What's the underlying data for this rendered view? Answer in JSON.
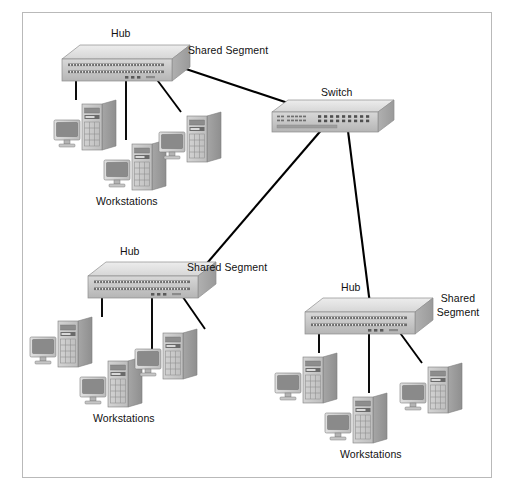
{
  "diagram": {
    "type": "network-topology",
    "background": "#ffffff",
    "frame_color": "#b9b9b9",
    "link_color": "#000000",
    "device_fill": "#c9c9c9",
    "device_top": "#e2e2e2",
    "device_side": "#a8a8a8",
    "monitor_screen": "#808080"
  },
  "labels": {
    "hub_top": "Hub",
    "hub_middle": "Hub",
    "hub_bottom_right": "Hub",
    "switch": "Switch",
    "shared_segment_top": "Shared Segment",
    "shared_segment_middle": "Shared Segment",
    "shared_segment_bottom_line1": "Shared",
    "shared_segment_bottom_line2": "Segment",
    "workstations_top": "Workstations",
    "workstations_middle": "Workstations",
    "workstations_bottom_right": "Workstations"
  },
  "devices": [
    {
      "id": "hub-top",
      "kind": "hub",
      "x": 62,
      "y": 45,
      "label": "Hub"
    },
    {
      "id": "switch",
      "kind": "switch",
      "x": 272,
      "y": 100,
      "label": "Switch"
    },
    {
      "id": "hub-middle",
      "kind": "hub",
      "x": 88,
      "y": 262,
      "label": "Hub"
    },
    {
      "id": "hub-bottom-right",
      "kind": "hub",
      "x": 305,
      "y": 298,
      "label": "Hub"
    }
  ],
  "workstation_groups": [
    {
      "id": "group-top",
      "label": "Workstations",
      "count": 3,
      "members": [
        "ws-top-1",
        "ws-top-2",
        "ws-top-3"
      ]
    },
    {
      "id": "group-middle",
      "label": "Workstations",
      "count": 3,
      "members": [
        "ws-mid-1",
        "ws-mid-2",
        "ws-mid-3"
      ]
    },
    {
      "id": "group-bottom-right",
      "label": "Workstations",
      "count": 3,
      "members": [
        "ws-br-1",
        "ws-br-2",
        "ws-br-3"
      ]
    }
  ],
  "links": [
    {
      "from": "hub-top",
      "to": "switch",
      "kind": "trunk"
    },
    {
      "from": "hub-middle",
      "to": "switch",
      "kind": "trunk"
    },
    {
      "from": "hub-bottom-right",
      "to": "switch",
      "kind": "trunk"
    },
    {
      "from": "hub-top",
      "to": "ws-top-1",
      "kind": "access"
    },
    {
      "from": "hub-top",
      "to": "ws-top-2",
      "kind": "access"
    },
    {
      "from": "hub-top",
      "to": "ws-top-3",
      "kind": "access"
    },
    {
      "from": "hub-middle",
      "to": "ws-mid-1",
      "kind": "access"
    },
    {
      "from": "hub-middle",
      "to": "ws-mid-2",
      "kind": "access"
    },
    {
      "from": "hub-middle",
      "to": "ws-mid-3",
      "kind": "access"
    },
    {
      "from": "hub-bottom-right",
      "to": "ws-br-1",
      "kind": "access"
    },
    {
      "from": "hub-bottom-right",
      "to": "ws-br-2",
      "kind": "access"
    },
    {
      "from": "hub-bottom-right",
      "to": "ws-br-3",
      "kind": "access"
    }
  ]
}
